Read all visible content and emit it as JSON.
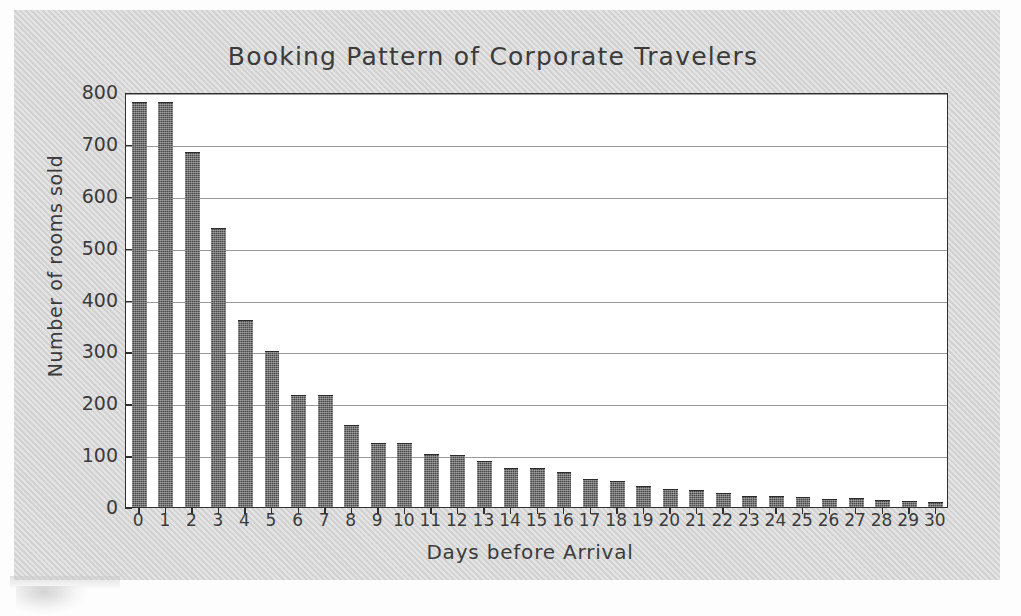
{
  "chart_data": {
    "type": "bar",
    "title": "Booking Pattern of Corporate Travelers",
    "xlabel": "Days before Arrival",
    "ylabel": "Number of rooms sold",
    "categories": [
      "0",
      "1",
      "2",
      "3",
      "4",
      "5",
      "6",
      "7",
      "8",
      "9",
      "10",
      "11",
      "12",
      "13",
      "14",
      "15",
      "16",
      "17",
      "18",
      "19",
      "20",
      "21",
      "22",
      "23",
      "24",
      "25",
      "26",
      "27",
      "28",
      "29",
      "30"
    ],
    "values": [
      780,
      780,
      685,
      538,
      360,
      300,
      216,
      215,
      158,
      123,
      124,
      103,
      100,
      88,
      76,
      76,
      68,
      54,
      50,
      41,
      35,
      32,
      27,
      22,
      21,
      19,
      16,
      17,
      13,
      11,
      9
    ],
    "ylim": [
      0,
      800
    ],
    "ytick_labels": [
      "0",
      "100",
      "200",
      "300",
      "400",
      "500",
      "600",
      "700",
      "800"
    ],
    "ytick_values": [
      0,
      100,
      200,
      300,
      400,
      500,
      600,
      700,
      800
    ],
    "grid": true,
    "legend": false,
    "bar_color": "#4a4a4a",
    "plot_background": "#ffffff",
    "page_background": "#d4d4d4"
  }
}
